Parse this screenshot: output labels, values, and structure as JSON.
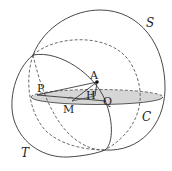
{
  "labels": {
    "S": "S",
    "T": "T",
    "C": "C",
    "P": "P",
    "A": "A",
    "H": "H",
    "M": "M",
    "Q": "Q"
  },
  "colors": {
    "stroke": "#333333",
    "disk_fill": "#d6d6d6"
  }
}
